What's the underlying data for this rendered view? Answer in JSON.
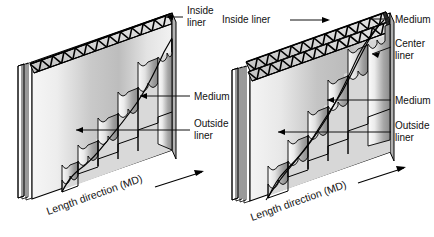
{
  "figure": {
    "background_color": "#ffffff",
    "line_color": "#111111"
  },
  "panels": [
    {
      "id": "singlewall",
      "name": "singlewall-corrugated-board",
      "labels": {
        "inside_liner": "Inside\nliner",
        "inside_liner_l1": "Inside",
        "inside_liner_l2": "liner",
        "medium": "Medium",
        "outside_liner_l1": "Outside",
        "outside_liner_l2": "liner",
        "direction": "Length direction (MD)"
      }
    },
    {
      "id": "doublewall",
      "name": "doublewall-corrugated-board",
      "labels": {
        "inside_liner": "Inside liner",
        "medium_top": "Medium",
        "center_liner_l1": "Center",
        "center_liner_l2": "liner",
        "medium_bottom": "Medium",
        "outside_liner_l1": "Outside",
        "outside_liner_l2": "liner",
        "direction": "Length direction (MD)"
      }
    }
  ],
  "colors": {
    "face_light": "#f4f4f4",
    "face_mid": "#d6d6d6",
    "face_dark": "#9a9a9a",
    "flute_light": "#fbfbfb",
    "flute_dark": "#8e8e8e",
    "liner_edge": "#2a2a2a",
    "stroke": "#000000"
  }
}
